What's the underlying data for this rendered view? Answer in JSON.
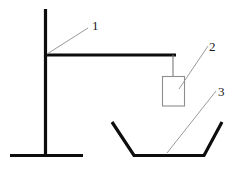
{
  "diagram": {
    "background_color": "#ffffff",
    "stroke_color": "#0d0d0d",
    "leader_color": "#9a9a9a",
    "outline_color": "#8d8d8d",
    "width": 238,
    "height": 170
  },
  "callouts": [
    {
      "id": "callout-1",
      "label": "1",
      "refers_to": "stand-frame",
      "label_x": 92,
      "label_y": 30,
      "leader": {
        "x1": 47,
        "y1": 54,
        "x2": 88,
        "y2": 28
      }
    },
    {
      "id": "callout-2",
      "label": "2",
      "refers_to": "suspended-weight",
      "label_x": 209,
      "label_y": 51,
      "leader": {
        "x1": 179,
        "y1": 89,
        "x2": 208,
        "y2": 46
      }
    },
    {
      "id": "callout-3",
      "label": "3",
      "refers_to": "trough-container",
      "label_x": 218,
      "label_y": 96,
      "leader": {
        "x1": 167,
        "y1": 153,
        "x2": 216,
        "y2": 91
      }
    }
  ],
  "parts": {
    "stand": {
      "name": "stand-frame",
      "vertical_post": {
        "x": 45,
        "y_top": 9,
        "y_bottom": 156
      },
      "horizontal_arm": {
        "y": 55,
        "x_left": 44,
        "x_right": 176
      },
      "base_foot": {
        "y": 155,
        "x_left": 10,
        "x_right": 83
      }
    },
    "weight": {
      "name": "suspended-weight",
      "hanger": {
        "x": 173,
        "y_top": 56,
        "y_bottom": 76
      },
      "box": {
        "x": 162,
        "y": 76,
        "width": 22,
        "height": 30
      }
    },
    "trough": {
      "name": "trough-container",
      "points": "112,122 134,155 204,155 222,122"
    }
  }
}
